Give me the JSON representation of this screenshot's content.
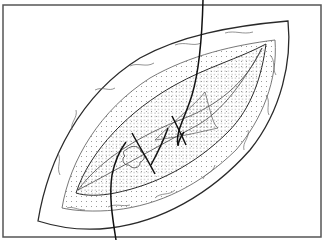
{
  "figure": {
    "width": 325,
    "height": 245,
    "colors": {
      "background": "#ffffff",
      "frame": "#555555",
      "line": "#2a2a2a",
      "stipple": "#8a8a8a",
      "suture": "#111111"
    },
    "frame": {
      "x": 3,
      "y": 5,
      "w": 318,
      "h": 232
    },
    "outer_skin": "M38,221 C48,160 80,95 140,58 C180,36 230,26 288,21 C292,60 282,110 250,150 C210,195 160,222 110,228 C85,231 60,228 38,221 Z",
    "skin_inner_edge": "M62,208 C70,160 100,110 150,78 C190,55 235,45 275,40 C278,80 262,120 236,150 C200,185 160,205 115,210 C95,212 75,211 62,208 Z",
    "wound_edge": "M76,193 C90,150 130,110 175,85 C205,68 240,58 266,44 C262,75 252,108 228,132 C195,165 155,185 115,193 C100,196 85,196 76,193 Z",
    "deep_layer": "M78,190 C100,160 140,135 185,118 C215,106 245,85 262,48 C245,80 222,112 196,126 C160,145 120,168 78,190 Z",
    "tissue_flap": "M155,140 C175,120 195,105 205,92 C210,110 213,125 218,128 C200,132 180,137 155,140 Z",
    "knot": "M126,150 c6,-6 14,-4 15,2 c5,1 4,9 -1,10 c1,6 -8,8 -11,3 c-6,1 -8,-7 -4,-9 c-3,-3 -1,-6 1,-6 Z",
    "suture_main": "M203,0 C202,40 198,75 192,95 C185,118 175,132 178,145",
    "suture_tail": "M116,240 C112,215 109,195 112,175 C115,160 120,150 126,142",
    "stitches": [
      "M132,133 C140,148 148,160 155,174",
      "M168,128 C163,142 158,152 151,165",
      "M172,116 C178,128 183,138 186,145",
      "M184,132 C180,138 178,142 178,146"
    ],
    "fat_lobules": [
      "M95,90 c8,-4 14,2 20,-2",
      "M130,66 c8,-4 16,2 24,-3",
      "M175,45 c10,-4 18,2 26,-2",
      "M225,33 c10,-3 18,2 28,-1",
      "M270,55 c6,6 2,14 6,20",
      "M266,95 c5,6 0,14 3,20",
      "M248,130 c2,8 -6,12 -4,20",
      "M215,165 c-2,8 -10,8 -12,14",
      "M175,190 c-6,6 -14,2 -20,8",
      "M130,205 c-8,2 -14,-2 -22,2",
      "M85,210 c-8,0 -12,-4 -18,-2",
      "M60,175 c-4,-8 2,-14 -2,-22",
      "M72,130 c-2,-8 6,-12 4,-20"
    ]
  }
}
